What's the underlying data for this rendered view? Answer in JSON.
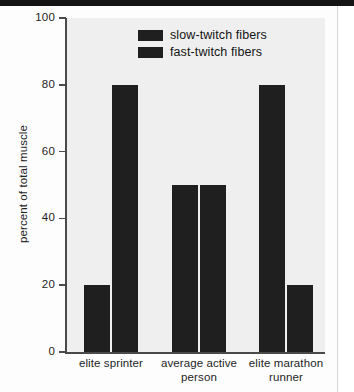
{
  "figure": {
    "background_color": "#efefef",
    "bar_color": "#1f1f1f",
    "axis_color": "#4a4a4a"
  },
  "legend": {
    "items": [
      {
        "label": "slow-twitch fibers",
        "color": "#1f1f1f"
      },
      {
        "label": "fast-twitch fibers",
        "color": "#1f1f1f"
      }
    ]
  },
  "y_axis": {
    "title": "percent of total muscle",
    "ticks": [
      "0",
      "20",
      "40",
      "60",
      "80",
      "100"
    ]
  },
  "chart_data": {
    "type": "bar",
    "title": "",
    "xlabel": "",
    "ylabel": "percent of total muscle",
    "ylim": [
      0,
      100
    ],
    "grid": false,
    "legend_position": "top-center",
    "categories": [
      "elite sprinter",
      "average active person",
      "elite marathon runner"
    ],
    "category_lines": [
      [
        "elite sprinter"
      ],
      [
        "average active",
        "person"
      ],
      [
        "elite marathon",
        "runner"
      ]
    ],
    "series": [
      {
        "name": "slow-twitch fibers",
        "values": [
          20,
          50,
          80
        ]
      },
      {
        "name": "fast-twitch fibers",
        "values": [
          80,
          50,
          20
        ]
      }
    ],
    "yticks": [
      0,
      20,
      40,
      60,
      80,
      100
    ],
    "units": "percent"
  }
}
